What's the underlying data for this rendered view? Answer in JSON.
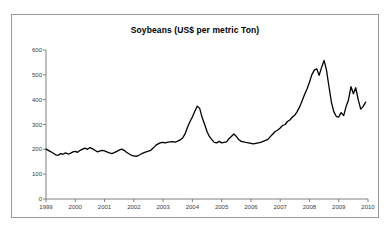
{
  "top_clipped_text": "",
  "chart_data": {
    "type": "line",
    "title": "Soybeans (US$ per metric Ton)",
    "xlabel": "",
    "ylabel": "",
    "grid": false,
    "legend": false,
    "line_color": "#000000",
    "axis_color": "#808080",
    "border_color": "#9a9a9a",
    "xlim": [
      1999,
      2010
    ],
    "ylim": [
      0,
      600
    ],
    "yticks": [
      0,
      100,
      200,
      300,
      400,
      500,
      600
    ],
    "ytick_labels": [
      "0",
      "100",
      "200",
      "300",
      "400",
      "500",
      "600"
    ],
    "xticks": [
      1999,
      2000,
      2001,
      2002,
      2003,
      2004,
      2005,
      2006,
      2007,
      2008,
      2009,
      2010
    ],
    "xtick_labels": [
      "1999",
      "2000",
      "2001",
      "2002",
      "2003",
      "2004",
      "2005",
      "2006",
      "2007",
      "2008",
      "2009",
      "2010"
    ],
    "series": [
      {
        "name": "Soybeans",
        "x": [
          1999.0,
          1999.08,
          1999.17,
          1999.25,
          1999.33,
          1999.42,
          1999.5,
          1999.58,
          1999.67,
          1999.75,
          1999.83,
          1999.92,
          2000.0,
          2000.08,
          2000.17,
          2000.25,
          2000.33,
          2000.42,
          2000.5,
          2000.58,
          2000.67,
          2000.75,
          2000.83,
          2000.92,
          2001.0,
          2001.08,
          2001.17,
          2001.25,
          2001.33,
          2001.42,
          2001.5,
          2001.58,
          2001.67,
          2001.75,
          2001.83,
          2001.92,
          2002.0,
          2002.08,
          2002.17,
          2002.25,
          2002.33,
          2002.42,
          2002.5,
          2002.58,
          2002.67,
          2002.75,
          2002.83,
          2002.92,
          2003.0,
          2003.08,
          2003.17,
          2003.25,
          2003.33,
          2003.42,
          2003.5,
          2003.58,
          2003.67,
          2003.75,
          2003.83,
          2003.92,
          2004.0,
          2004.08,
          2004.17,
          2004.25,
          2004.33,
          2004.42,
          2004.5,
          2004.58,
          2004.67,
          2004.75,
          2004.83,
          2004.92,
          2005.0,
          2005.08,
          2005.17,
          2005.25,
          2005.33,
          2005.42,
          2005.5,
          2005.58,
          2005.67,
          2005.75,
          2005.83,
          2005.92,
          2006.0,
          2006.08,
          2006.17,
          2006.25,
          2006.33,
          2006.42,
          2006.5,
          2006.58,
          2006.67,
          2006.75,
          2006.83,
          2006.92,
          2007.0,
          2007.08,
          2007.17,
          2007.25,
          2007.33,
          2007.42,
          2007.5,
          2007.58,
          2007.67,
          2007.75,
          2007.83,
          2007.92,
          2008.0,
          2008.08,
          2008.17,
          2008.25,
          2008.33,
          2008.42,
          2008.5,
          2008.58,
          2008.67,
          2008.75,
          2008.83,
          2008.92,
          2009.0,
          2009.08,
          2009.17,
          2009.25,
          2009.33,
          2009.42,
          2009.5,
          2009.58,
          2009.67,
          2009.75,
          2009.83,
          2009.92
        ],
        "values": [
          201,
          196,
          190,
          184,
          178,
          176,
          183,
          180,
          186,
          181,
          184,
          190,
          192,
          188,
          196,
          201,
          205,
          200,
          207,
          203,
          196,
          190,
          193,
          196,
          194,
          190,
          186,
          183,
          187,
          192,
          197,
          201,
          196,
          188,
          182,
          176,
          174,
          172,
          176,
          181,
          186,
          190,
          193,
          196,
          206,
          216,
          222,
          227,
          228,
          226,
          229,
          230,
          231,
          229,
          233,
          238,
          246,
          262,
          288,
          312,
          330,
          352,
          374,
          365,
          330,
          300,
          272,
          252,
          238,
          228,
          226,
          232,
          226,
          228,
          230,
          243,
          252,
          262,
          252,
          240,
          232,
          230,
          228,
          226,
          224,
          222,
          224,
          226,
          228,
          232,
          236,
          240,
          252,
          262,
          272,
          278,
          286,
          296,
          300,
          312,
          318,
          330,
          338,
          352,
          372,
          396,
          420,
          444,
          470,
          500,
          520,
          524,
          498,
          532,
          558,
          520,
          450,
          390,
          352,
          332,
          330,
          348,
          336,
          372,
          398,
          452,
          424,
          448,
          398,
          362,
          372,
          390
        ]
      }
    ]
  }
}
